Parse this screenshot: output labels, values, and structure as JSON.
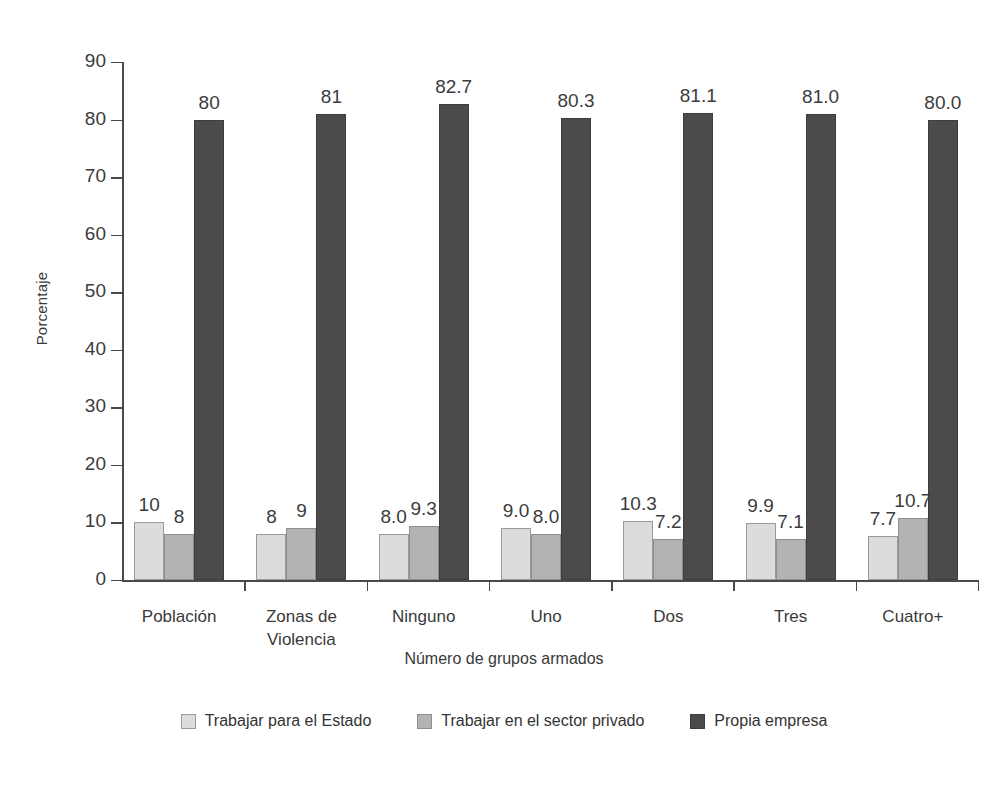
{
  "chart_data": {
    "type": "bar",
    "title": "",
    "xlabel": "Número de grupos armados",
    "ylabel": "Porcentaje",
    "ylim": [
      0,
      90
    ],
    "yticks": [
      0,
      10,
      20,
      30,
      40,
      50,
      60,
      70,
      80,
      90
    ],
    "grid": false,
    "legend_position": "bottom",
    "categories": [
      "Población",
      "Zonas de\nViolencia",
      "Ninguno",
      "Uno",
      "Dos",
      "Tres",
      "Cuatro+"
    ],
    "series": [
      {
        "name": "Trabajar para el Estado",
        "color": "#dcdcdc",
        "values": [
          10,
          8,
          8.0,
          9.0,
          10.3,
          9.9,
          7.7
        ],
        "labels": [
          "10",
          "8",
          "8.0",
          "9.0",
          "10.3",
          "9.9",
          "7.7"
        ]
      },
      {
        "name": "Trabajar en el sector privado",
        "color": "#b3b3b3",
        "values": [
          8,
          9,
          9.3,
          8.0,
          7.2,
          7.1,
          10.7
        ],
        "labels": [
          "8",
          "9",
          "9.3",
          "8.0",
          "7.2",
          "7.1",
          "10.7"
        ]
      },
      {
        "name": "Propia empresa",
        "color": "#4b4b4b",
        "values": [
          80,
          81,
          82.7,
          80.3,
          81.1,
          81.0,
          80.0
        ],
        "labels": [
          "80",
          "81",
          "82.7",
          "80.3",
          "81.1",
          "81.0",
          "80.0"
        ]
      }
    ]
  },
  "axis": {
    "y_title": "Porcentaje",
    "x_title": "Número de grupos armados"
  },
  "legend": {
    "items": [
      {
        "label": "Trabajar para el Estado",
        "swatch": "light-gray-swatch"
      },
      {
        "label": "Trabajar en el sector privado",
        "swatch": "medium-gray-swatch"
      },
      {
        "label": "Propia empresa",
        "swatch": "dark-gray-swatch"
      }
    ]
  }
}
